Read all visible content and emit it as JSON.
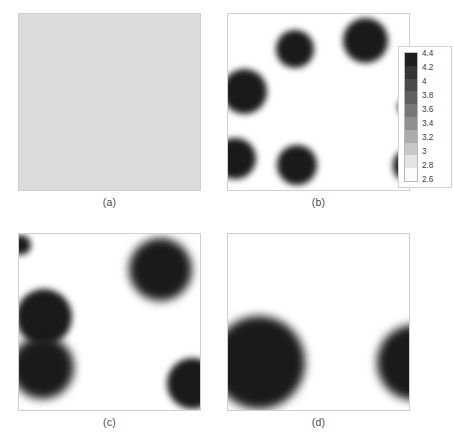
{
  "figure": {
    "title": "",
    "panel_count": 4,
    "layout": "2x2 grid of grayscale field maps"
  },
  "panels": [
    {
      "id": "a",
      "caption": "(a)",
      "description": "uniform field"
    },
    {
      "id": "b",
      "caption": "(b)",
      "description": "nucleated droplets"
    },
    {
      "id": "c",
      "caption": "(c)",
      "description": "coarsened merged domains"
    },
    {
      "id": "d",
      "caption": "(d)",
      "description": "large coalesced domains"
    }
  ],
  "colorbar": {
    "min": 2.6,
    "max": 4.4,
    "step": 0.2,
    "orientation": "vertical",
    "high_color": "#1a1a1a",
    "low_color": "#ffffff",
    "ticks": [
      "4.4",
      "4.2",
      "4",
      "3.8",
      "3.6",
      "3.4",
      "3.2",
      "3",
      "2.8",
      "2.6"
    ],
    "segment_colors": [
      "#1f1f1f",
      "#343434",
      "#4a4a4a",
      "#606060",
      "#787878",
      "#909090",
      "#acacac",
      "#c8c8c8",
      "#e4e4e4",
      "#fbfbfb"
    ]
  },
  "chart_data": {
    "type": "heatmap",
    "title": "",
    "xlabel": "",
    "ylabel": "",
    "colormap": "gray-reversed",
    "value_range": [
      2.6,
      4.4
    ],
    "colorbar_ticks": [
      4.4,
      4.2,
      4.0,
      3.8,
      3.6,
      3.4,
      3.2,
      3.0,
      2.8,
      2.6
    ],
    "background_value": 2.6,
    "blob_value": 4.4,
    "panels": [
      {
        "id": "a",
        "caption": "(a)",
        "uniform": true,
        "uniform_value": 3.1,
        "blobs": []
      },
      {
        "id": "b",
        "caption": "(b)",
        "uniform": false,
        "blobs": [
          {
            "cx": 0.37,
            "cy": 0.2,
            "r": 0.105
          },
          {
            "cx": 0.76,
            "cy": 0.15,
            "r": 0.125
          },
          {
            "cx": 0.09,
            "cy": 0.44,
            "r": 0.125
          },
          {
            "cx": 0.04,
            "cy": 0.82,
            "r": 0.115
          },
          {
            "cx": 0.38,
            "cy": 0.86,
            "r": 0.11
          },
          {
            "cx": 0.99,
            "cy": 0.53,
            "r": 0.05
          },
          {
            "cx": 1.0,
            "cy": 0.86,
            "r": 0.09
          }
        ]
      },
      {
        "id": "c",
        "caption": "(c)",
        "uniform": false,
        "blobs": [
          {
            "cx": 0.78,
            "cy": 0.2,
            "r": 0.175
          },
          {
            "cx": 0.14,
            "cy": 0.47,
            "r": 0.155
          },
          {
            "cx": 0.13,
            "cy": 0.76,
            "r": 0.175
          },
          {
            "cx": 0.96,
            "cy": 0.85,
            "r": 0.14
          },
          {
            "cx": 0.01,
            "cy": 0.06,
            "r": 0.055
          }
        ]
      },
      {
        "id": "d",
        "caption": "(d)",
        "uniform": false,
        "blobs": [
          {
            "cx": 0.17,
            "cy": 0.73,
            "r": 0.255
          },
          {
            "cx": 1.03,
            "cy": 0.73,
            "r": 0.205
          }
        ]
      }
    ]
  }
}
